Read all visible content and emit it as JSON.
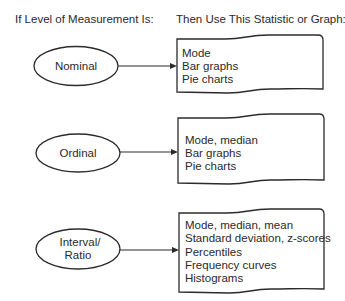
{
  "headers": {
    "left": "If Level of Measurement Is:",
    "right": "Then Use This Statistic or Graph:"
  },
  "rows": [
    {
      "level": {
        "lines": [
          "Nominal"
        ]
      },
      "statistics": [
        "Mode",
        "Bar graphs",
        "Pie charts"
      ]
    },
    {
      "level": {
        "lines": [
          "Ordinal"
        ]
      },
      "statistics": [
        "Mode, median",
        "Bar graphs",
        "Pie charts"
      ]
    },
    {
      "level": {
        "lines": [
          "Interval/",
          "Ratio"
        ]
      },
      "statistics": [
        "Mode, median, mean",
        "Standard deviation, z-scores",
        "Percentiles",
        "Frequency curves",
        "Histograms"
      ]
    }
  ],
  "colors": {
    "stroke": "#2b2b2b",
    "text": "#2a2a2a",
    "background": "#ffffff"
  }
}
